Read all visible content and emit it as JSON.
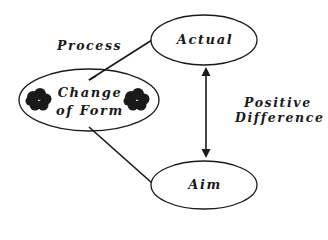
{
  "diagram": {
    "type": "concept-diagram",
    "colors": {
      "stroke": "#1a1a1a",
      "fill": "#ffffff",
      "blob": "#1a1a1a",
      "background": "#ffffff"
    },
    "nodes": [
      {
        "id": "actual",
        "label": "Actual",
        "shape": "ellipse"
      },
      {
        "id": "change",
        "label_lines": [
          "Change",
          "of Form"
        ],
        "shape": "ellipse",
        "decorations": [
          "blob-left",
          "blob-right"
        ]
      },
      {
        "id": "aim",
        "label": "Aim",
        "shape": "ellipse"
      }
    ],
    "edges": [
      {
        "from": "change",
        "to": "actual",
        "style": "line",
        "label": "Process"
      },
      {
        "from": "change",
        "to": "aim",
        "style": "line",
        "label": ""
      },
      {
        "from": "actual",
        "to": "aim",
        "style": "double-arrow",
        "label_lines": [
          "Positive",
          "Difference"
        ]
      }
    ]
  },
  "labels": {
    "actual": "Actual",
    "change_line1": "Change",
    "change_line2": "of Form",
    "aim": "Aim",
    "process": "Process",
    "positive": "Positive",
    "difference": "Difference"
  }
}
